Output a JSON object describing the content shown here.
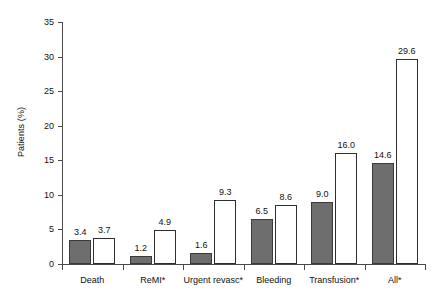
{
  "chart_data": {
    "type": "bar",
    "title": "",
    "subtitle": "",
    "xlabel": "",
    "ylabel": "Patients (%)",
    "ylim": [
      0,
      35
    ],
    "ytick_values": [
      0,
      5,
      10,
      15,
      20,
      25,
      30,
      35
    ],
    "ytick_labels": [
      "0",
      "5",
      "10",
      "15",
      "20",
      "25",
      "30",
      "35"
    ],
    "grid": false,
    "legend": "none",
    "categories": [
      "Death",
      "ReMI*",
      "Urgent revasc*",
      "Bleeding",
      "Transfusion*",
      "All*"
    ],
    "series": [
      {
        "name": "series-1",
        "style": "filled-dark-gray",
        "color": "#6e6e6e",
        "values": [
          3.4,
          1.2,
          1.6,
          6.5,
          9.0,
          14.6
        ],
        "labels": [
          "3.4",
          "1.2",
          "1.6",
          "6.5",
          "9.0",
          "14.6"
        ]
      },
      {
        "name": "series-2",
        "style": "open-white",
        "color": "#ffffff",
        "values": [
          3.7,
          4.9,
          9.3,
          8.6,
          16.0,
          29.6
        ],
        "labels": [
          "3.7",
          "4.9",
          "9.3",
          "8.6",
          "16.0",
          "29.6"
        ]
      }
    ]
  },
  "colors": {
    "series_dark": "#6e6e6e",
    "series_light": "#ffffff",
    "bar_outline": "#2e2e2e",
    "axis": "#4a4a4a",
    "text": "#111111",
    "background": "#ffffff"
  }
}
